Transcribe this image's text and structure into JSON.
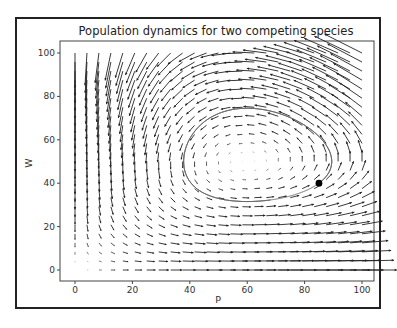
{
  "chart_data": {
    "type": "quiver",
    "title": "Population dynamics for two competing species",
    "xlabel": "P",
    "ylabel": "W",
    "xlim": [
      -5,
      105
    ],
    "ylim": [
      -5,
      105
    ],
    "xticks": [
      0,
      20,
      40,
      60,
      80,
      100
    ],
    "yticks": [
      0,
      20,
      40,
      60,
      80,
      100
    ],
    "grid": false,
    "vector_field": {
      "model": "Lotka-Volterra predator-prey",
      "grid_range": [
        0,
        100
      ],
      "grid_points_per_axis": 25,
      "equilibrium": {
        "P": 60,
        "W": 50
      },
      "directions": "dP/dt = P(1 - W/50), dW/dt = W(P/60 - 1)"
    },
    "trajectory": {
      "type": "closed-orbit",
      "approx_bounds": {
        "P_min": 38,
        "P_max": 88,
        "W_min": 31,
        "W_max": 77
      }
    },
    "marker": {
      "P": 85,
      "W": 40,
      "color": "#000000"
    }
  }
}
